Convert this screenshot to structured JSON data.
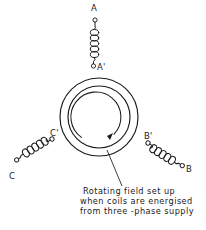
{
  "figure": {
    "background_color": "#ffffff",
    "ink_color": "#1a1a1a"
  },
  "stator": {
    "label": "stator ring",
    "outer_radius": 39,
    "inner_radius": 31,
    "center_x": 99,
    "center_y": 117
  },
  "rotation": {
    "label": "rotating field arrow",
    "direction": "clockwise"
  },
  "coils": [
    {
      "id": "coil-a",
      "phase": "A",
      "start_terminal": "A",
      "end_terminal": "A'",
      "orientation": "top",
      "turns": 5
    },
    {
      "id": "coil-b",
      "phase": "B",
      "start_terminal": "B'",
      "end_terminal": "B",
      "orientation": "lower-right",
      "turns": 5
    },
    {
      "id": "coil-c",
      "phase": "C",
      "start_terminal": "C'",
      "end_terminal": "C",
      "orientation": "lower-left",
      "turns": 5
    }
  ],
  "terminal_labels": {
    "a": "A",
    "a_prime": "A'",
    "b": "B",
    "b_prime": "B'",
    "c": "C",
    "c_prime": "C'"
  },
  "caption": {
    "line1": "Rotating field set up",
    "line2": "when coils are energised",
    "line3": "from three -phase supply"
  }
}
